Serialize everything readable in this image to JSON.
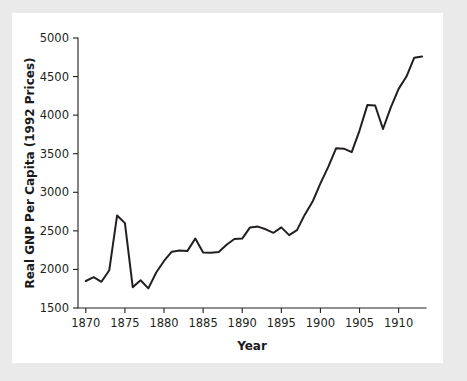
{
  "figure": {
    "background_color": "#eaeaea",
    "card_color": "#ffffff",
    "line_color": "#231f20"
  },
  "chart_data": {
    "type": "line",
    "title": "",
    "xlabel": "Year",
    "ylabel": "Real GNP Per Capita (1992 Prices)",
    "xlim": [
      1869,
      1913.5
    ],
    "ylim": [
      1500,
      5000
    ],
    "xticks": [
      1870,
      1875,
      1880,
      1885,
      1890,
      1895,
      1900,
      1905,
      1910
    ],
    "yticks": [
      1500,
      2000,
      2500,
      3000,
      3500,
      4000,
      4500,
      5000
    ],
    "xtick_labels": [
      "1870",
      "1875",
      "1880",
      "1885",
      "1890",
      "1895",
      "1900",
      "1905",
      "1910"
    ],
    "ytick_labels": [
      "1500",
      "2000",
      "2500",
      "3000",
      "3500",
      "4000",
      "4500",
      "5000"
    ],
    "grid": false,
    "legend": null,
    "series": [
      {
        "name": "Real GNP Per Capita (1992 Prices)",
        "color": "#231f20",
        "x": [
          1870,
          1871,
          1872,
          1873,
          1874,
          1875,
          1876,
          1877,
          1878,
          1879,
          1880,
          1881,
          1882,
          1883,
          1884,
          1885,
          1886,
          1887,
          1888,
          1889,
          1890,
          1891,
          1892,
          1893,
          1894,
          1895,
          1896,
          1897,
          1898,
          1899,
          1900,
          1901,
          1902,
          1903,
          1904,
          1905,
          1906,
          1907,
          1908,
          1909,
          1910,
          1911,
          1912,
          1913
        ],
        "values": [
          1850,
          1900,
          1840,
          1990,
          2700,
          2600,
          1770,
          1860,
          1755,
          1960,
          2110,
          2230,
          2245,
          2240,
          2400,
          2220,
          2215,
          2225,
          2320,
          2395,
          2400,
          2545,
          2555,
          2520,
          2475,
          2545,
          2445,
          2510,
          2710,
          2880,
          3115,
          3330,
          3570,
          3565,
          3520,
          3800,
          4130,
          4125,
          3820,
          4100,
          4340,
          4500,
          4745,
          4760
        ]
      }
    ],
    "annotations": []
  }
}
